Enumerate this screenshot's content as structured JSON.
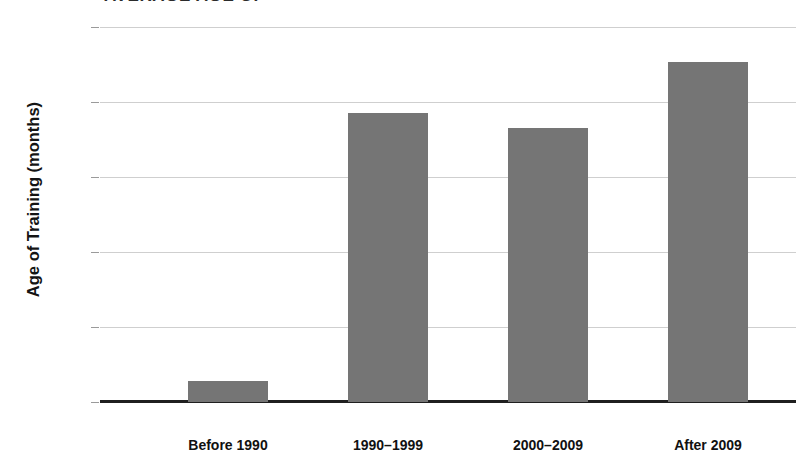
{
  "chart_data": {
    "type": "bar",
    "title": "AVERAGE AGE OF",
    "subtitle": "",
    "xlabel": "",
    "ylabel": "Age of Training (months)",
    "categories": [
      "Before 1990",
      "1990–1999",
      "2000–2009",
      "After 2009"
    ],
    "values": [
      30.14,
      31.93,
      31.83,
      32.27
    ],
    "ylim": [
      30,
      32.5
    ],
    "yticks": [
      30,
      30.5,
      31,
      31.5,
      32,
      32.5
    ],
    "ytick_labels": [
      "30",
      "30.5",
      "31",
      "31.5",
      "32",
      "32.5"
    ],
    "grid": true,
    "legend": "none",
    "bar_color": "#757575",
    "gridline_color": "#cfcfcf",
    "axis_color": "#1f1f1f",
    "series": [
      {
        "name": "Age of Training (months)",
        "values": [
          30.14,
          31.93,
          31.83,
          32.27
        ]
      }
    ]
  }
}
